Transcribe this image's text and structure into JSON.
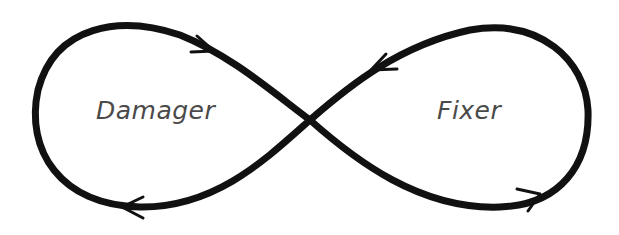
{
  "diagram": {
    "type": "infinity-loop",
    "labels": {
      "left": "Damager",
      "right": "Fixer"
    },
    "colors": {
      "stroke": "#111111",
      "text": "#4a4a4a",
      "background": "#ffffff"
    },
    "arrows": [
      {
        "position": "left-loop-top",
        "direction": "toward-center"
      },
      {
        "position": "right-loop-top",
        "direction": "toward-center"
      },
      {
        "position": "left-loop-bottom",
        "direction": "away-from-center"
      },
      {
        "position": "right-loop-bottom",
        "direction": "away-from-center"
      }
    ]
  }
}
